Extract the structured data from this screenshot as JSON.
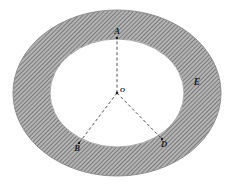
{
  "figure": {
    "type": "annulus-with-radii",
    "caption": "",
    "colors": {
      "ring_fill": "#b4b4b4",
      "hatch_line": "#4a4a4a",
      "inner_fill": "#ffffff",
      "outline": "#8a8a8a",
      "dash_line": "#333333",
      "label_color": "#1a1a1a",
      "background": "#ffffff"
    },
    "geometry": {
      "center": {
        "x": 117,
        "y": 93
      },
      "outer_rx": 104,
      "outer_ry": 83,
      "inner_rx": 67,
      "inner_ry": 54,
      "hatch_angle_deg": 45,
      "hatch_spacing_px": 3
    },
    "labels": {
      "center": "O",
      "top": "A",
      "lower_left": "B",
      "lower_right": "D",
      "ring_region": "E"
    },
    "points": [
      {
        "name": "A",
        "label": "A",
        "x": 117,
        "y": 38
      },
      {
        "name": "B",
        "label": "B",
        "x": 79,
        "y": 143
      },
      {
        "name": "D",
        "label": "D",
        "x": 162,
        "y": 139
      }
    ],
    "radii": [
      {
        "from": "O",
        "to": "A",
        "style": "dashed"
      },
      {
        "from": "O",
        "to": "B",
        "style": "dashed"
      },
      {
        "from": "O",
        "to": "D",
        "style": "dashed"
      }
    ],
    "ring_label_position": {
      "x": 197,
      "y": 82
    }
  }
}
